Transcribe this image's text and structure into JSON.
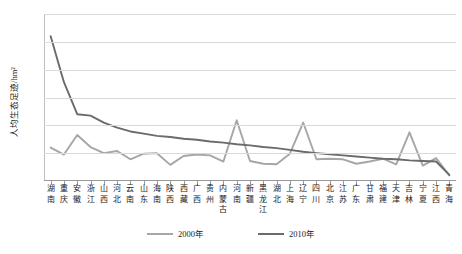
{
  "chart_data": {
    "type": "line",
    "title": "",
    "xlabel": "",
    "ylabel": "人均生态足迹/hm²",
    "ylim": [
      0.0,
      6.0
    ],
    "ytick_labels": [
      "0.0",
      "1.0",
      "2.0",
      "3.0",
      "4.0",
      "5.0",
      "6.0"
    ],
    "ytick_values": [
      0.0,
      1.0,
      2.0,
      3.0,
      4.0,
      5.0,
      6.0
    ],
    "grid": true,
    "legend_position": "bottom-center",
    "categories": [
      "湖南",
      "重庆",
      "安徽",
      "浙江",
      "山西",
      "河北",
      "云南",
      "山东",
      "海南",
      "陕西",
      "西藏",
      "广西",
      "贵州",
      "内蒙古",
      "河南",
      "新疆",
      "黑龙江",
      "湖北",
      "上海",
      "辽宁",
      "四川",
      "北京",
      "江苏",
      "广东",
      "甘肃",
      "福建",
      "天津",
      "吉林",
      "宁夏",
      "江西",
      "青海"
    ],
    "series": [
      {
        "name": "2000年",
        "color": "#a6a6a6",
        "values": [
          1.2,
          0.95,
          1.65,
          1.22,
          1.0,
          1.08,
          0.78,
          0.98,
          1.0,
          0.58,
          0.9,
          0.95,
          0.92,
          0.7,
          2.18,
          0.72,
          0.62,
          0.6,
          0.98,
          2.1,
          0.78,
          0.8,
          0.78,
          0.62,
          0.7,
          0.8,
          0.6,
          1.75,
          0.55,
          0.82,
          0.2
        ]
      },
      {
        "name": "2010年",
        "color": "#6b6b6b",
        "values": [
          5.2,
          3.55,
          2.4,
          2.35,
          2.1,
          1.92,
          1.78,
          1.7,
          1.62,
          1.58,
          1.52,
          1.48,
          1.42,
          1.38,
          1.32,
          1.28,
          1.22,
          1.18,
          1.12,
          1.05,
          1.0,
          0.96,
          0.92,
          0.88,
          0.84,
          0.8,
          0.78,
          0.74,
          0.72,
          0.7,
          0.22
        ]
      }
    ],
    "legend": [
      {
        "label": "2000年",
        "color": "#a6a6a6"
      },
      {
        "label": "2010年",
        "color": "#6b6b6b"
      }
    ]
  }
}
